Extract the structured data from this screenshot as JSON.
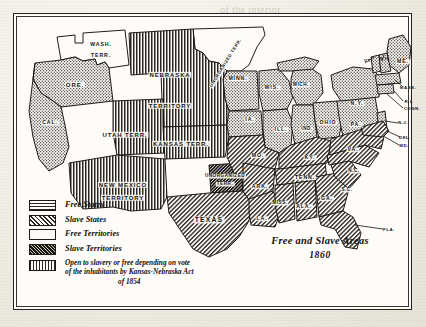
{
  "document": {
    "kind": "historical-map",
    "title_line1": "Free and Slave Areas",
    "title_line2": "1860"
  },
  "legend": {
    "items": [
      {
        "swatch": "crosshatch-dot-pattern",
        "label": "Free States"
      },
      {
        "swatch": "diagonal-hatch-pattern",
        "label": "Slave States"
      },
      {
        "swatch": "blank-white-pattern",
        "label": "Free Territories"
      },
      {
        "swatch": "dense-dark-pattern",
        "label": "Slave Territories"
      },
      {
        "swatch": "vertical-stripe-pattern",
        "label_line1": "Open to slavery or free depending on vote",
        "label_line2": "of the inhabitants by Kansas-Nebraska Act",
        "label_line3": "of 1854"
      }
    ]
  },
  "map": {
    "regions": [
      {
        "name": "washington-territory",
        "label": "WASH.\nTERR.",
        "l1": "WASH.",
        "l2": "TERR.",
        "x": 88,
        "y": 32,
        "size": "s10",
        "fill": "free-territory"
      },
      {
        "name": "oregon",
        "label": "ORE.",
        "x": 62,
        "y": 72,
        "size": "s11",
        "fill": "free-state"
      },
      {
        "name": "california",
        "label": "CAL.",
        "x": 37,
        "y": 110,
        "size": "s10",
        "fill": "free-state"
      },
      {
        "name": "utah-territory",
        "label": "UTAH  TERR.",
        "x": 112,
        "y": 122,
        "size": "s11",
        "fill": "open-vote"
      },
      {
        "name": "nebraska-territory",
        "l1": "NEBRASKA",
        "l2": "TERRITORY",
        "x": 157,
        "y": 62,
        "y2": 93,
        "size": "s11",
        "fill": "open-vote"
      },
      {
        "name": "kansas-territory",
        "label": "KANSAS  TERR.",
        "x": 168,
        "y": 131,
        "size": "s11",
        "fill": "open-vote"
      },
      {
        "name": "new-mexico-territory",
        "l1": "NEW  MEXICO",
        "l2": "TERRITORY",
        "x": 110,
        "y": 172,
        "y2": 185,
        "size": "s11",
        "fill": "open-vote"
      },
      {
        "name": "unorganized-territory-north",
        "label": "UNORGANIZED TERR.",
        "x": 213,
        "y": 50,
        "size": "diag",
        "fill": "free-territory"
      },
      {
        "name": "unorganized-territory-south",
        "l1": "UNORGANIZED",
        "l2": "TERR.",
        "x": 212,
        "y": 163,
        "y2": 171,
        "size": "s9",
        "fill": "slave-territory"
      },
      {
        "name": "texas",
        "label": "TEXAS",
        "x": 196,
        "y": 207,
        "size": "s12",
        "fill": "slave-state"
      },
      {
        "name": "minnesota",
        "label": "MINN.",
        "x": 225,
        "y": 66,
        "size": "s10",
        "fill": "free-state"
      },
      {
        "name": "wisconsin",
        "label": "WIS.",
        "x": 259,
        "y": 75,
        "size": "s10",
        "fill": "free-state"
      },
      {
        "name": "michigan",
        "label": "MICH.",
        "x": 288,
        "y": 72,
        "size": "s9",
        "fill": "free-state"
      },
      {
        "name": "iowa",
        "label": "IA.",
        "x": 237,
        "y": 107,
        "size": "s10",
        "fill": "free-state"
      },
      {
        "name": "illinois",
        "label": "ILL.",
        "x": 268,
        "y": 117,
        "size": "s10",
        "fill": "free-state"
      },
      {
        "name": "indiana",
        "label": "IND.",
        "x": 294,
        "y": 116,
        "size": "s9",
        "fill": "free-state"
      },
      {
        "name": "ohio",
        "label": "OHIO",
        "x": 315,
        "y": 110,
        "size": "s10",
        "fill": "free-state"
      },
      {
        "name": "missouri",
        "label": "MO.",
        "x": 245,
        "y": 143,
        "size": "s10",
        "fill": "slave-state"
      },
      {
        "name": "kentucky",
        "label": "KY.",
        "x": 297,
        "y": 145,
        "size": "s10",
        "fill": "slave-state"
      },
      {
        "name": "tennessee",
        "label": "TENN.",
        "x": 292,
        "y": 165,
        "size": "s10",
        "fill": "slave-state"
      },
      {
        "name": "arkansas",
        "label": "ARK.",
        "x": 247,
        "y": 174,
        "size": "s10",
        "fill": "slave-state"
      },
      {
        "name": "mississippi",
        "label": "MISS.",
        "x": 267,
        "y": 190,
        "size": "s9",
        "fill": "slave-state"
      },
      {
        "name": "alabama",
        "label": "ALA.",
        "x": 291,
        "y": 194,
        "size": "s10",
        "fill": "slave-state"
      },
      {
        "name": "georgia",
        "label": "GA.",
        "x": 314,
        "y": 186,
        "size": "s10",
        "fill": "slave-state"
      },
      {
        "name": "louisiana",
        "label": "LA.",
        "x": 249,
        "y": 206,
        "size": "s10",
        "fill": "slave-state"
      },
      {
        "name": "south-carolina",
        "label": "S.C.",
        "x": 334,
        "y": 177,
        "size": "s9",
        "fill": "slave-state"
      },
      {
        "name": "north-carolina",
        "label": "N.C.",
        "x": 341,
        "y": 158,
        "size": "s9",
        "fill": "slave-state"
      },
      {
        "name": "virginia",
        "label": "VA.",
        "x": 340,
        "y": 137,
        "size": "s10",
        "fill": "slave-state"
      },
      {
        "name": "new-york",
        "label": "N.Y.",
        "x": 344,
        "y": 91,
        "size": "s10",
        "fill": "free-state"
      },
      {
        "name": "pennsylvania",
        "label": "PA.",
        "x": 343,
        "y": 112,
        "size": "s10",
        "fill": "free-state"
      },
      {
        "name": "maine",
        "label": "ME.",
        "x": 390,
        "y": 49,
        "size": "s10",
        "fill": "free-state"
      }
    ],
    "callouts": [
      {
        "name": "vermont",
        "label": "VT.",
        "x": 355,
        "y": 48
      },
      {
        "name": "new-hampshire",
        "label": "N.H.",
        "x": 372,
        "y": 46
      },
      {
        "name": "massachusetts",
        "label": "MASS.",
        "x": 395,
        "y": 75
      },
      {
        "name": "rhode-island",
        "label": "R.I.",
        "x": 396,
        "y": 89
      },
      {
        "name": "connecticut",
        "label": "CONN.",
        "x": 399,
        "y": 96
      },
      {
        "name": "new-jersey",
        "label": "N.J.",
        "x": 390,
        "y": 110
      },
      {
        "name": "delaware",
        "label": "DEL.",
        "x": 392,
        "y": 125
      },
      {
        "name": "maryland",
        "label": "MD.",
        "x": 391,
        "y": 133
      },
      {
        "name": "florida",
        "label": "FLA.",
        "x": 376,
        "y": 217
      }
    ]
  },
  "bleed_through": [
    {
      "text": "of the interior",
      "x": 220,
      "y": 4,
      "size": 10
    },
    {
      "text": "developing a Studio",
      "x": 160,
      "y": 47,
      "size": 11
    },
    {
      "text": "in the assembly work",
      "x": 158,
      "y": 62,
      "size": 11
    },
    {
      "text": "The writer",
      "x": 236,
      "y": 79,
      "size": 11
    },
    {
      "text": "own indicating the",
      "x": 150,
      "y": 96,
      "size": 11
    },
    {
      "text": "a means of",
      "x": 30,
      "y": 236,
      "size": 10
    },
    {
      "text": "tions must be",
      "x": 30,
      "y": 256,
      "size": 10
    },
    {
      "text": "in the",
      "x": 30,
      "y": 276,
      "size": 10
    },
    {
      "text": "copy",
      "x": 300,
      "y": 286,
      "size": 10
    }
  ]
}
